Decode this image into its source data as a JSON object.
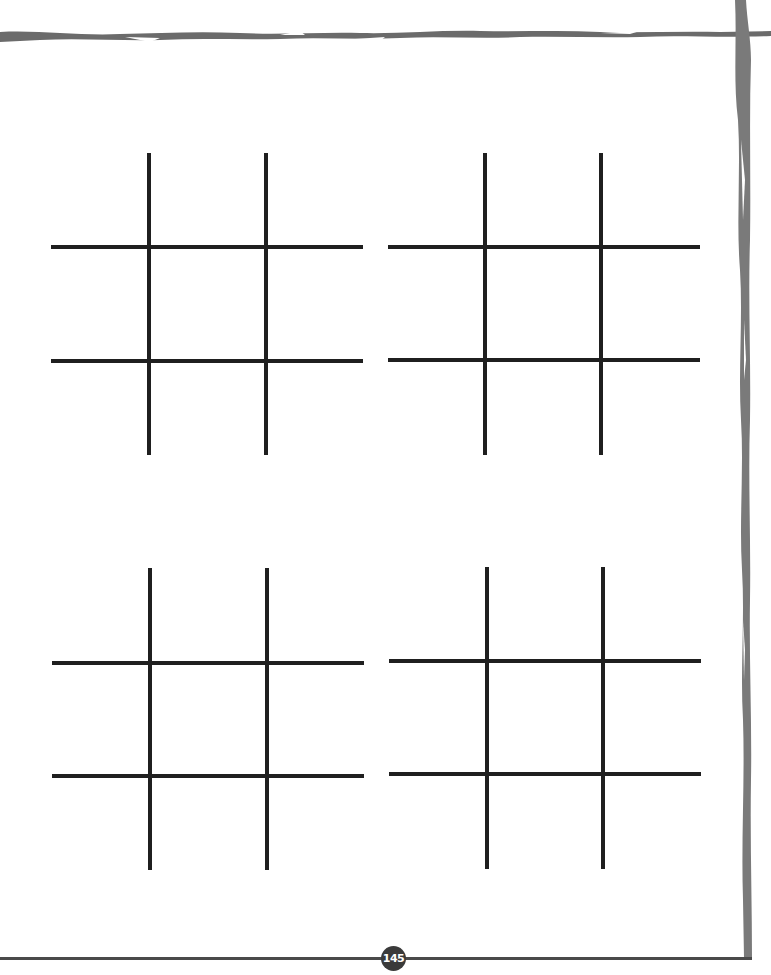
{
  "page": {
    "page_number": "145",
    "border_color": "#6b6b6b",
    "line_color": "#1f1f1f"
  },
  "boards": [
    {
      "id": "board-1",
      "position": "top-left",
      "cells": 9
    },
    {
      "id": "board-2",
      "position": "top-right",
      "cells": 9
    },
    {
      "id": "board-3",
      "position": "bottom-left",
      "cells": 9
    },
    {
      "id": "board-4",
      "position": "bottom-right",
      "cells": 9
    }
  ]
}
